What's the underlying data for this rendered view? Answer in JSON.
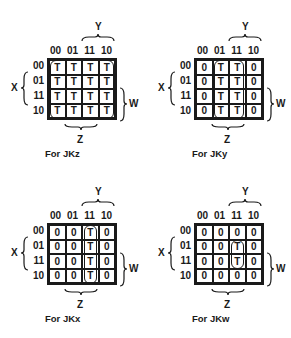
{
  "maps": [
    {
      "id": "jkz",
      "caption": "For JKz",
      "y_label": "Y",
      "z_label": "Z",
      "x_label": "X",
      "w_label": "W",
      "col_headers": [
        "00",
        "01",
        "11",
        "10"
      ],
      "row_headers": [
        "00",
        "01",
        "11",
        "10"
      ],
      "cells": [
        [
          "T",
          "T",
          "T",
          "T"
        ],
        [
          "T",
          "T",
          "T",
          "T"
        ],
        [
          "T",
          "T",
          "T",
          "T"
        ],
        [
          "T",
          "T",
          "T",
          "T"
        ]
      ],
      "loop": "all cells"
    },
    {
      "id": "jky",
      "caption": "For JKy",
      "y_label": "Y",
      "z_label": "Z",
      "x_label": "X",
      "w_label": "W",
      "col_headers": [
        "00",
        "01",
        "11",
        "10"
      ],
      "row_headers": [
        "00",
        "01",
        "11",
        "10"
      ],
      "cells": [
        [
          "0",
          "T",
          "T",
          "0"
        ],
        [
          "0",
          "T",
          "T",
          "0"
        ],
        [
          "0",
          "T",
          "T",
          "0"
        ],
        [
          "0",
          "T",
          "T",
          "0"
        ]
      ],
      "loop": "columns 01 and 11"
    },
    {
      "id": "jkx",
      "caption": "For JKx",
      "y_label": "Y",
      "z_label": "Z",
      "x_label": "X",
      "w_label": "W",
      "col_headers": [
        "00",
        "01",
        "11",
        "10"
      ],
      "row_headers": [
        "00",
        "01",
        "11",
        "10"
      ],
      "cells": [
        [
          "0",
          "0",
          "T",
          "0"
        ],
        [
          "0",
          "0",
          "T",
          "0"
        ],
        [
          "0",
          "0",
          "T",
          "0"
        ],
        [
          "0",
          "0",
          "T",
          "0"
        ]
      ],
      "loop": "column 11"
    },
    {
      "id": "jkw",
      "caption": "For JKw",
      "y_label": "Y",
      "z_label": "Z",
      "x_label": "X",
      "w_label": "W",
      "col_headers": [
        "00",
        "01",
        "11",
        "10"
      ],
      "row_headers": [
        "00",
        "01",
        "11",
        "10"
      ],
      "cells": [
        [
          "0",
          "0",
          "0",
          "0"
        ],
        [
          "0",
          "0",
          "T",
          "0"
        ],
        [
          "0",
          "0",
          "T",
          "0"
        ],
        [
          "0",
          "0",
          "0",
          "0"
        ]
      ],
      "loop": "column 11, rows 01 and 11"
    }
  ]
}
